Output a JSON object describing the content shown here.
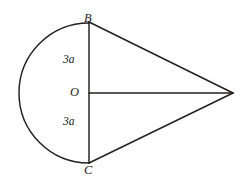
{
  "figure": {
    "kind": "geometry-diagram",
    "background_color": "#ffffff",
    "stroke_color": "#22201f",
    "labels": {
      "top_point": "B",
      "bottom_point": "C",
      "center_point": "O",
      "upper_segment": "3a",
      "lower_segment": "3a"
    },
    "geometry": {
      "center": {
        "x": 89,
        "y": 93
      },
      "radius": 70,
      "point_B": {
        "x": 89,
        "y": 23
      },
      "point_C": {
        "x": 89,
        "y": 163
      },
      "apex": {
        "x": 232,
        "y": 93
      },
      "arc_sweep_degrees": 180,
      "arc_side": "left"
    }
  }
}
